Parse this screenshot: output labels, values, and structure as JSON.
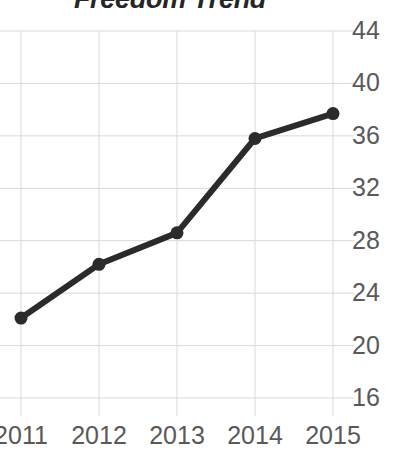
{
  "chart_data": {
    "type": "line",
    "title": "Freedom Trend",
    "xlabel": "",
    "ylabel": "",
    "categories": [
      "2011",
      "2012",
      "2013",
      "2014",
      "2015"
    ],
    "x": [
      2011,
      2012,
      2013,
      2014,
      2015
    ],
    "values": [
      22.1,
      26.2,
      28.6,
      35.8,
      37.7
    ],
    "series": [
      {
        "name": "Freedom Trend",
        "values": [
          22.1,
          26.2,
          28.6,
          35.8,
          37.7
        ],
        "color": "#2b2b2b",
        "marker": "circle",
        "line_width": 6
      }
    ],
    "ylim": [
      16,
      44
    ],
    "yticks": [
      44,
      40,
      36,
      32,
      28,
      24,
      20,
      16
    ],
    "ytick_labels": [
      "44",
      "40",
      "36",
      "32",
      "28",
      "24",
      "20",
      "16"
    ],
    "xticks": [
      2011,
      2012,
      2013,
      2014,
      2015
    ],
    "xtick_labels": [
      "2011",
      "2012",
      "2013",
      "2014",
      "2015"
    ],
    "grid": true,
    "grid_color": "#d9d9d9",
    "legend": false,
    "legend_position": "none",
    "axis_label_color": "#595959",
    "title_color": "#262626",
    "background": "#ffffff"
  },
  "axis": {
    "y_labels": [
      "44",
      "40",
      "36",
      "32",
      "28",
      "24",
      "20",
      "16"
    ],
    "x_labels": [
      "2011",
      "2012",
      "2013",
      "2014",
      "2015"
    ]
  }
}
